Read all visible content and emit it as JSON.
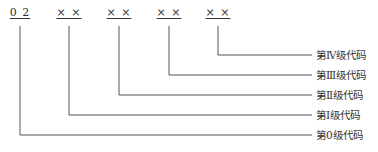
{
  "diagram": {
    "codes": [
      {
        "text": "0 2",
        "x": 20
      },
      {
        "text": "× ×",
        "x": 69
      },
      {
        "text": "× ×",
        "x": 119
      },
      {
        "text": "× ×",
        "x": 169
      },
      {
        "text": "× ×",
        "x": 218
      }
    ],
    "labels": [
      {
        "text": "第Ⅳ级代码",
        "y": 55
      },
      {
        "text": "第Ⅲ级代码",
        "y": 75
      },
      {
        "text": "第Ⅱ级代码",
        "y": 95
      },
      {
        "text": "第Ⅰ级代码",
        "y": 115
      },
      {
        "text": "第0级代码",
        "y": 135
      }
    ],
    "line_color": "#555555"
  }
}
